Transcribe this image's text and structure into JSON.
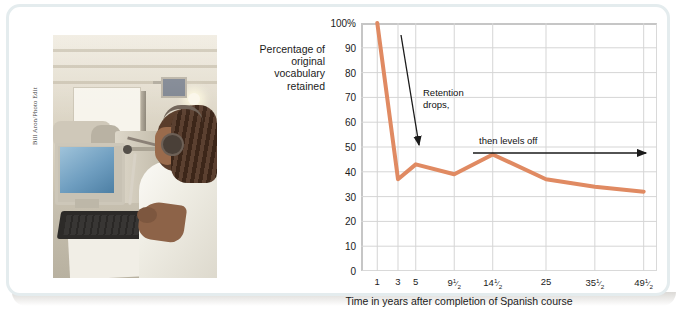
{
  "figure": {
    "photo_credit": "Bill Aron/Photo Edit",
    "photo_alt": "Student wearing a headset working at a computer in a language lab"
  },
  "chart_data": {
    "type": "line",
    "title": "",
    "xlabel": "Time in years after completion of Spanish course",
    "ylabel": "Percentage of original vocabulary retained",
    "categories": [
      "1",
      "3",
      "5",
      "9½",
      "14½",
      "25",
      "35½",
      "49½"
    ],
    "x_tick_labels": [
      {
        "text": "1",
        "whole": "1",
        "frac": ""
      },
      {
        "text": "3",
        "whole": "3",
        "frac": ""
      },
      {
        "text": "5",
        "whole": "5",
        "frac": ""
      },
      {
        "text": "9½",
        "whole": "9",
        "frac": "1/2"
      },
      {
        "text": "14½",
        "whole": "14",
        "frac": "1/2"
      },
      {
        "text": "25",
        "whole": "25",
        "frac": ""
      },
      {
        "text": "35½",
        "whole": "35",
        "frac": "1/2"
      },
      {
        "text": "49½",
        "whole": "49",
        "frac": "1/2"
      }
    ],
    "values": [
      100,
      37,
      43,
      39,
      47,
      37,
      34,
      32
    ],
    "y_tick_labels": [
      "100%",
      "90",
      "80",
      "70",
      "60",
      "50",
      "40",
      "30",
      "20",
      "10",
      "0"
    ],
    "y_ticks": [
      100,
      90,
      80,
      70,
      60,
      50,
      40,
      30,
      20,
      10,
      0
    ],
    "ylim": [
      0,
      100
    ],
    "grid": "both",
    "legend": "none",
    "line_color": "#e08a62",
    "grid_color": "#d5d5d5",
    "annotations": [
      {
        "id": "retention-drops",
        "text_line1": "Retention",
        "text_line2": "drops,",
        "arrow": "down"
      },
      {
        "id": "levels-off",
        "text": "then levels off",
        "arrow": "right"
      }
    ]
  }
}
